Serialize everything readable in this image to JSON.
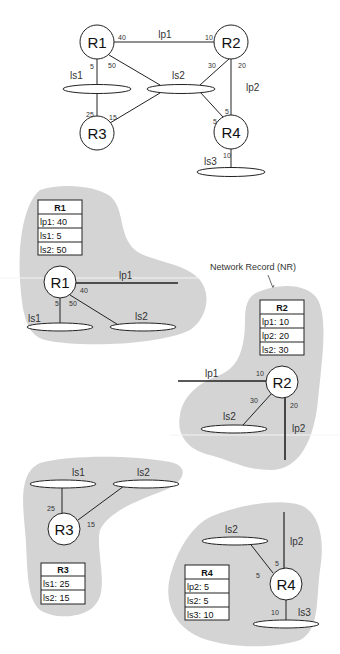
{
  "topology": {
    "routers": [
      "R1",
      "R2",
      "R3",
      "R4"
    ],
    "links": [
      {
        "name": "lp1",
        "type": "point-to-point"
      },
      {
        "name": "lp2",
        "type": "point-to-point"
      },
      {
        "name": "ls1",
        "type": "shared"
      },
      {
        "name": "ls2",
        "type": "shared"
      },
      {
        "name": "ls3",
        "type": "shared"
      }
    ],
    "costs": {
      "r1_lp1": "40",
      "r1_ls1": "5",
      "r1_ls2": "50",
      "r2_lp1": "10",
      "r2_ls2": "30",
      "r2_lp2": "20",
      "r3_ls1": "25",
      "r3_ls2": "15",
      "r4_ls2": "5",
      "r4_lp2": "5",
      "r4_ls3": "10"
    }
  },
  "annotation": "Network Record (NR)",
  "records": {
    "r1": {
      "title": "R1",
      "rows": [
        "lp1: 40",
        "ls1: 5",
        "ls2: 50"
      ]
    },
    "r2": {
      "title": "R2",
      "rows": [
        "lp1: 10",
        "lp2: 20",
        "ls2: 30"
      ]
    },
    "r3": {
      "title": "R3",
      "rows": [
        "ls1: 25",
        "ls2: 15"
      ]
    },
    "r4": {
      "title": "R4",
      "rows": [
        "lp2: 5",
        "ls2: 5",
        "ls3: 10"
      ]
    }
  },
  "colors": {
    "region": "#d4d4d4",
    "line": "#222222",
    "node_fill": "#ffffff"
  }
}
